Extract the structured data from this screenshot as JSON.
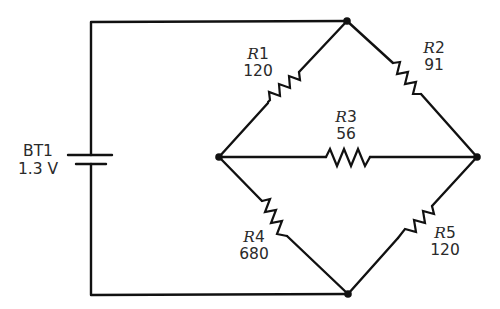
{
  "diagram": {
    "type": "circuit-schematic"
  },
  "battery": {
    "ref": "BT1",
    "value": "1.3 V"
  },
  "resistors": [
    {
      "ref_letter": "R",
      "ref_num": "1",
      "value": "120",
      "from": "top",
      "to": "left"
    },
    {
      "ref_letter": "R",
      "ref_num": "2",
      "value": "91",
      "from": "top",
      "to": "right"
    },
    {
      "ref_letter": "R",
      "ref_num": "3",
      "value": "56",
      "from": "left",
      "to": "right"
    },
    {
      "ref_letter": "R",
      "ref_num": "4",
      "value": "680",
      "from": "left",
      "to": "bottom"
    },
    {
      "ref_letter": "R",
      "ref_num": "5",
      "value": "120",
      "from": "right",
      "to": "bottom"
    }
  ],
  "nodes": [
    "top",
    "left",
    "right",
    "bottom"
  ],
  "colors": {
    "wire": "#111111",
    "text": "#2a2a2a",
    "background": "#ffffff"
  }
}
